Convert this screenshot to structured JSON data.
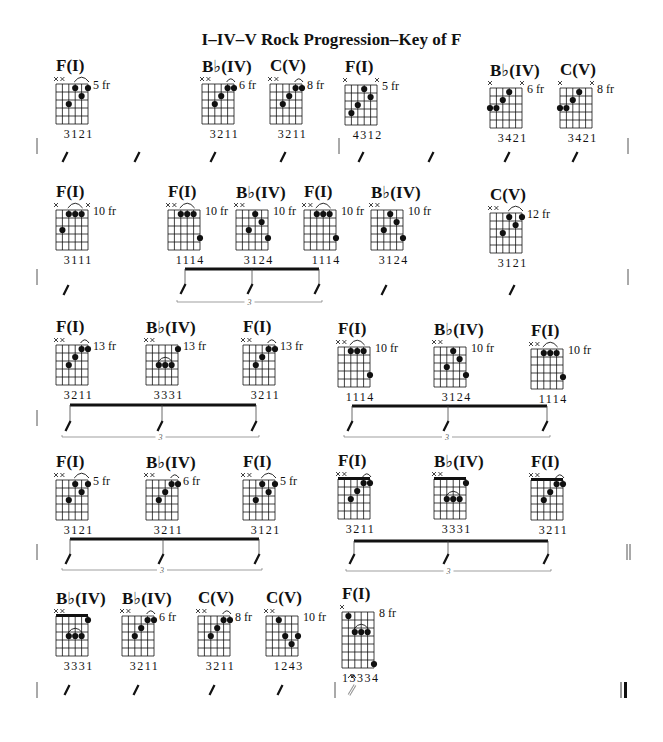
{
  "title": "I–IV–V Rock Progression–Key of F",
  "colors": {
    "ink": "#111111",
    "light_ink": "#555555",
    "background": "#ffffff"
  },
  "grid": {
    "strings": 6,
    "frets": 5,
    "string_spacing": 6.4,
    "fret_spacing": 8
  },
  "chords": [
    {
      "id": "r1c1",
      "name": "F(I)",
      "x": 56,
      "y": 84,
      "mutes": [
        0,
        1
      ],
      "dots": [
        [
          2,
          3
        ],
        [
          3,
          1
        ],
        [
          4,
          2
        ],
        [
          5,
          1
        ]
      ],
      "arc": [
        3,
        5
      ],
      "fret": "5 fr",
      "fingers": "3121"
    },
    {
      "id": "r1c2",
      "name": "B♭(IV)",
      "x": 202,
      "y": 84,
      "mutes": [
        0,
        1
      ],
      "dots": [
        [
          2,
          3
        ],
        [
          3,
          2
        ],
        [
          4,
          1
        ],
        [
          5,
          1
        ]
      ],
      "arc": [
        4,
        5
      ],
      "fret": "6 fr",
      "fingers": "3211"
    },
    {
      "id": "r1c3",
      "name": "C(V)",
      "x": 270,
      "y": 84,
      "mutes": [
        0,
        1
      ],
      "dots": [
        [
          2,
          3
        ],
        [
          3,
          2
        ],
        [
          4,
          1
        ],
        [
          5,
          1
        ]
      ],
      "arc": [
        4,
        5
      ],
      "fret": "8 fr",
      "fingers": "3211"
    },
    {
      "id": "r1c4",
      "name": "F(I)",
      "x": 345,
      "y": 85,
      "mutes": [
        0,
        5
      ],
      "dots": [
        [
          1,
          4
        ],
        [
          2,
          3
        ],
        [
          3,
          1
        ],
        [
          4,
          2
        ]
      ],
      "arc": null,
      "fret": "5 fr",
      "fingers": "4312"
    },
    {
      "id": "r1c5",
      "name": "B♭(IV)",
      "x": 490,
      "y": 88,
      "mutes": [
        0,
        5
      ],
      "dots": [
        [
          0,
          3
        ],
        [
          1,
          3
        ],
        [
          2,
          2
        ],
        [
          3,
          1
        ]
      ],
      "arc": null,
      "fret": "6 fr",
      "fingers": "3421"
    },
    {
      "id": "r1c6",
      "name": "C(V)",
      "x": 560,
      "y": 88,
      "mutes": [
        0,
        5
      ],
      "dots": [
        [
          0,
          3
        ],
        [
          1,
          3
        ],
        [
          2,
          2
        ],
        [
          3,
          1
        ]
      ],
      "arc": null,
      "fret": "8 fr",
      "fingers": "3421"
    },
    {
      "id": "r2c1",
      "name": "F(I)",
      "x": 56,
      "y": 210,
      "mutes": [
        0,
        5
      ],
      "dots": [
        [
          1,
          3
        ],
        [
          2,
          1
        ],
        [
          3,
          1
        ],
        [
          4,
          1
        ]
      ],
      "arc": [
        2,
        4
      ],
      "fret": "10 fr",
      "fingers": "3111"
    },
    {
      "id": "r2c2",
      "name": "F(I)",
      "x": 168,
      "y": 210,
      "mutes": [
        0,
        1
      ],
      "dots": [
        [
          2,
          1
        ],
        [
          3,
          1
        ],
        [
          4,
          1
        ],
        [
          5,
          4
        ]
      ],
      "arc": [
        2,
        4
      ],
      "fret": "10 fr",
      "fingers": "1114",
      "fret_side": "right"
    },
    {
      "id": "r2c3",
      "name": "B♭(IV)",
      "x": 236,
      "y": 210,
      "mutes": [
        0,
        1
      ],
      "dots": [
        [
          2,
          3
        ],
        [
          3,
          1
        ],
        [
          4,
          2
        ],
        [
          5,
          4
        ]
      ],
      "arc": null,
      "fret": "10 fr",
      "fingers": "3124",
      "fret_side": "right"
    },
    {
      "id": "r2c4",
      "name": "F(I)",
      "x": 304,
      "y": 210,
      "mutes": [
        0,
        1
      ],
      "dots": [
        [
          2,
          1
        ],
        [
          3,
          1
        ],
        [
          4,
          1
        ],
        [
          5,
          4
        ]
      ],
      "arc": [
        2,
        4
      ],
      "fret": "10 fr",
      "fingers": "1114",
      "fret_side": "right"
    },
    {
      "id": "r2c5",
      "name": "B♭(IV)",
      "x": 371,
      "y": 210,
      "mutes": [
        0,
        1
      ],
      "dots": [
        [
          2,
          3
        ],
        [
          3,
          1
        ],
        [
          4,
          2
        ],
        [
          5,
          4
        ]
      ],
      "arc": null,
      "fret": "10 fr",
      "fingers": "3124"
    },
    {
      "id": "r2c6",
      "name": "C(V)",
      "x": 490,
      "y": 213,
      "mutes": [
        0,
        1
      ],
      "dots": [
        [
          2,
          3
        ],
        [
          3,
          1
        ],
        [
          4,
          2
        ],
        [
          5,
          1
        ]
      ],
      "arc": [
        3,
        5
      ],
      "fret": "12 fr",
      "fingers": "3121"
    },
    {
      "id": "r3c1",
      "name": "F(I)",
      "x": 56,
      "y": 345,
      "mutes": [
        0,
        1
      ],
      "dots": [
        [
          2,
          3
        ],
        [
          3,
          2
        ],
        [
          4,
          1
        ],
        [
          5,
          1
        ]
      ],
      "arc": [
        4,
        5
      ],
      "fret": "13 fr",
      "fingers": "3211"
    },
    {
      "id": "r3c2",
      "name": "B♭(IV)",
      "x": 146,
      "y": 345,
      "mutes": [
        0,
        1
      ],
      "dots": [
        [
          2,
          3
        ],
        [
          3,
          3
        ],
        [
          4,
          3
        ],
        [
          5,
          1
        ]
      ],
      "arc": [
        2,
        4
      ],
      "arc_fret": 3,
      "fret": "13 fr",
      "fingers": "3331"
    },
    {
      "id": "r3c3",
      "name": "F(I)",
      "x": 243,
      "y": 345,
      "mutes": [
        0,
        1
      ],
      "dots": [
        [
          2,
          3
        ],
        [
          3,
          2
        ],
        [
          4,
          1
        ],
        [
          5,
          1
        ]
      ],
      "arc": [
        4,
        5
      ],
      "fret": "13 fr",
      "fingers": "3211"
    },
    {
      "id": "r3c4",
      "name": "F(I)",
      "x": 338,
      "y": 347,
      "mutes": [
        0,
        1
      ],
      "dots": [
        [
          2,
          1
        ],
        [
          3,
          1
        ],
        [
          4,
          1
        ],
        [
          5,
          4
        ]
      ],
      "arc": [
        2,
        4
      ],
      "fret": "10 fr",
      "fingers": "1114"
    },
    {
      "id": "r3c5",
      "name": "B♭(IV)",
      "x": 434,
      "y": 347,
      "mutes": [
        0,
        1
      ],
      "dots": [
        [
          2,
          3
        ],
        [
          3,
          1
        ],
        [
          4,
          2
        ],
        [
          5,
          4
        ]
      ],
      "arc": null,
      "fret": "10 fr",
      "fingers": "3124"
    },
    {
      "id": "r3c6",
      "name": "F(I)",
      "x": 531,
      "y": 349,
      "mutes": [
        0,
        1
      ],
      "dots": [
        [
          2,
          1
        ],
        [
          3,
          1
        ],
        [
          4,
          1
        ],
        [
          5,
          4
        ]
      ],
      "arc": [
        2,
        4
      ],
      "fret": "10 fr",
      "fingers": "1114"
    },
    {
      "id": "r4c1",
      "name": "F(I)",
      "x": 56,
      "y": 480,
      "mutes": [
        0,
        1
      ],
      "dots": [
        [
          2,
          3
        ],
        [
          3,
          1
        ],
        [
          4,
          2
        ],
        [
          5,
          1
        ]
      ],
      "arc": [
        3,
        5
      ],
      "fret": "5 fr",
      "fingers": "3121"
    },
    {
      "id": "r4c2",
      "name": "B♭(IV)",
      "x": 146,
      "y": 480,
      "mutes": [
        0,
        1
      ],
      "dots": [
        [
          2,
          3
        ],
        [
          3,
          2
        ],
        [
          4,
          1
        ],
        [
          5,
          1
        ]
      ],
      "arc": [
        4,
        5
      ],
      "fret": "6 fr",
      "fingers": "3211"
    },
    {
      "id": "r4c3",
      "name": "F(I)",
      "x": 243,
      "y": 480,
      "mutes": [
        0,
        1
      ],
      "dots": [
        [
          2,
          3
        ],
        [
          3,
          1
        ],
        [
          4,
          2
        ],
        [
          5,
          1
        ]
      ],
      "arc": [
        3,
        5
      ],
      "fret": "5 fr",
      "fingers": "3121"
    },
    {
      "id": "r4c4",
      "name": "F(I)",
      "x": 338,
      "y": 479,
      "mutes": [
        0,
        1
      ],
      "dots": [
        [
          2,
          3
        ],
        [
          3,
          2
        ],
        [
          4,
          1
        ],
        [
          5,
          1
        ]
      ],
      "arc": [
        4,
        5
      ],
      "nut": true,
      "fret": "",
      "fingers": "3211"
    },
    {
      "id": "r4c5",
      "name": "B♭(IV)",
      "x": 434,
      "y": 479,
      "mutes": [
        0,
        1
      ],
      "dots": [
        [
          2,
          3
        ],
        [
          3,
          3
        ],
        [
          4,
          3
        ],
        [
          5,
          1
        ]
      ],
      "arc": [
        2,
        4
      ],
      "arc_fret": 3,
      "nut": true,
      "fret": "",
      "fingers": "3331"
    },
    {
      "id": "r4c6",
      "name": "F(I)",
      "x": 531,
      "y": 480,
      "mutes": [
        0,
        1
      ],
      "dots": [
        [
          2,
          3
        ],
        [
          3,
          2
        ],
        [
          4,
          1
        ],
        [
          5,
          1
        ]
      ],
      "arc": [
        4,
        5
      ],
      "nut": true,
      "fret": "",
      "fingers": "3211"
    },
    {
      "id": "r5c1",
      "name": "B♭(IV)",
      "x": 56,
      "y": 616,
      "mutes": [
        0,
        1
      ],
      "dots": [
        [
          2,
          3
        ],
        [
          3,
          3
        ],
        [
          4,
          3
        ],
        [
          5,
          1
        ]
      ],
      "arc": [
        2,
        4
      ],
      "arc_fret": 3,
      "nut": true,
      "fret": "",
      "fingers": "3331"
    },
    {
      "id": "r5c2",
      "name": "B♭(IV)",
      "x": 122,
      "y": 616,
      "mutes": [
        0,
        1
      ],
      "dots": [
        [
          2,
          3
        ],
        [
          3,
          2
        ],
        [
          4,
          1
        ],
        [
          5,
          1
        ]
      ],
      "arc": [
        4,
        5
      ],
      "fret": "6 fr",
      "fingers": "3211"
    },
    {
      "id": "r5c3",
      "name": "C(V)",
      "x": 198,
      "y": 616,
      "mutes": [
        0,
        1
      ],
      "dots": [
        [
          2,
          3
        ],
        [
          3,
          2
        ],
        [
          4,
          1
        ],
        [
          5,
          1
        ]
      ],
      "arc": [
        4,
        5
      ],
      "fret": "8 fr",
      "fingers": "3211"
    },
    {
      "id": "r5c4",
      "name": "C(V)",
      "x": 266,
      "y": 616,
      "mutes": [
        0,
        1
      ],
      "dots": [
        [
          2,
          1
        ],
        [
          3,
          3
        ],
        [
          4,
          4
        ],
        [
          5,
          3
        ]
      ],
      "arc": null,
      "fret": "10 fr",
      "fingers": "1243"
    },
    {
      "id": "r5c5",
      "name": "F(I)",
      "x": 342,
      "y": 612,
      "mutes": [
        0
      ],
      "dots": [
        [
          1,
          1
        ],
        [
          2,
          3
        ],
        [
          3,
          3
        ],
        [
          4,
          3
        ],
        [
          5,
          7
        ]
      ],
      "arc": [
        2,
        4
      ],
      "arc_fret": 3,
      "frets": 7,
      "fret": "8 fr",
      "fingers": "13334"
    }
  ],
  "rows": [
    {
      "id": "row1",
      "barlines": [
        {
          "x": 37,
          "y": 146,
          "type": "single"
        },
        {
          "x": 339,
          "y": 146,
          "type": "single"
        },
        {
          "x": 628,
          "y": 146,
          "type": "single"
        }
      ],
      "slashes": [
        {
          "x": 65,
          "y": 157
        },
        {
          "x": 137,
          "y": 157
        },
        {
          "x": 213,
          "y": 157
        },
        {
          "x": 283,
          "y": 157
        },
        {
          "x": 361,
          "y": 157
        },
        {
          "x": 431,
          "y": 157
        },
        {
          "x": 507,
          "y": 157
        },
        {
          "x": 575,
          "y": 157
        }
      ],
      "triplets": []
    },
    {
      "id": "row2",
      "barlines": [
        {
          "x": 37,
          "y": 277,
          "type": "single"
        },
        {
          "x": 628,
          "y": 277,
          "type": "single"
        }
      ],
      "slashes": [
        {
          "x": 66,
          "y": 290
        },
        {
          "x": 384,
          "y": 290
        },
        {
          "x": 512,
          "y": 290
        }
      ],
      "triplets": [
        {
          "x1": 185,
          "x2": 319,
          "beam_y": 269,
          "stems": [
            185,
            252,
            319
          ],
          "stem_bottom": 290,
          "bracket_y": 302,
          "label": "3"
        }
      ]
    },
    {
      "id": "row3",
      "barlines": [
        {
          "x": 37,
          "y": 418,
          "type": "single"
        }
      ],
      "slashes": [],
      "triplets": [
        {
          "x1": 70,
          "x2": 256,
          "beam_y": 405,
          "stems": [
            70,
            162,
            256
          ],
          "stem_bottom": 427,
          "bracket_y": 437,
          "label": "3"
        },
        {
          "x1": 352,
          "x2": 547,
          "beam_y": 406,
          "stems": [
            352,
            448,
            547
          ],
          "stem_bottom": 427,
          "bracket_y": 437,
          "label": "3"
        }
      ]
    },
    {
      "id": "row4",
      "barlines": [
        {
          "x": 37,
          "y": 552,
          "type": "single"
        },
        {
          "x": 627,
          "y": 552,
          "type": "double"
        }
      ],
      "slashes": [],
      "triplets": [
        {
          "x1": 70,
          "x2": 259,
          "beam_y": 539,
          "stems": [
            70,
            163,
            259
          ],
          "stem_bottom": 560,
          "bracket_y": 570,
          "label": "3"
        },
        {
          "x1": 354,
          "x2": 548,
          "beam_y": 541,
          "stems": [
            354,
            448,
            548
          ],
          "stem_bottom": 560,
          "bracket_y": 571,
          "label": "3"
        }
      ]
    },
    {
      "id": "row5",
      "barlines": [
        {
          "x": 37,
          "y": 690,
          "type": "single"
        },
        {
          "x": 335,
          "y": 690,
          "type": "single"
        },
        {
          "x": 625,
          "y": 690,
          "type": "final"
        }
      ],
      "slashes": [
        {
          "x": 67,
          "y": 690
        },
        {
          "x": 136,
          "y": 690
        },
        {
          "x": 212,
          "y": 690
        },
        {
          "x": 280,
          "y": 690
        }
      ],
      "whole_slash": {
        "x": 352,
        "y": 690
      },
      "fermata": {
        "x": 352,
        "y": 678
      },
      "triplets": []
    }
  ]
}
